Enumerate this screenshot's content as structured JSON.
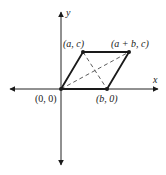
{
  "diagram": {
    "type": "coordinate-plane-parallelogram",
    "axes": {
      "x_label": "x",
      "y_label": "y"
    },
    "points": [
      {
        "id": "origin",
        "label": "(0, 0)"
      },
      {
        "id": "a_c",
        "label": "(a, c)"
      },
      {
        "id": "apb_c",
        "label": "(a + b, c)"
      },
      {
        "id": "b_0",
        "label": "(b, 0)"
      }
    ],
    "diagonals": [
      "(0,0) to (a + b, c)",
      "(a, c) to (b, 0)"
    ],
    "colors": {
      "line": "#1a1a1a",
      "axis": "#222222"
    }
  }
}
